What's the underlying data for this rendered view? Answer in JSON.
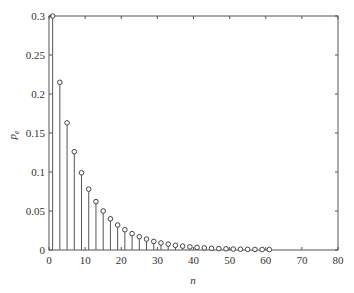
{
  "chart_data": {
    "type": "stem",
    "title": "",
    "xlabel": "n",
    "ylabel": "p_e",
    "xlim": [
      0,
      80
    ],
    "ylim": [
      0,
      0.3
    ],
    "grid": false,
    "legend": null,
    "x_ticks": [
      0,
      10,
      20,
      30,
      40,
      50,
      60,
      70,
      80
    ],
    "y_ticks": [
      0,
      0.05,
      0.1,
      0.15,
      0.2,
      0.25,
      0.3
    ],
    "x_tick_labels": [
      "0",
      "10",
      "20",
      "30",
      "40",
      "50",
      "60",
      "70",
      "80"
    ],
    "y_tick_labels": [
      "0",
      "0.05",
      "0.1",
      "0.15",
      "0.2",
      "0.25",
      "0.3"
    ],
    "marker": "open-circle",
    "series": [
      {
        "name": "p_e",
        "x": [
          1,
          3,
          5,
          7,
          9,
          11,
          13,
          15,
          17,
          19,
          21,
          23,
          25,
          27,
          29,
          31,
          33,
          35,
          37,
          39,
          41,
          43,
          45,
          47,
          49,
          51,
          53,
          55,
          57,
          59,
          61
        ],
        "values": [
          0.3,
          0.215,
          0.163,
          0.126,
          0.099,
          0.078,
          0.062,
          0.05,
          0.04,
          0.032,
          0.026,
          0.021,
          0.017,
          0.014,
          0.011,
          0.009,
          0.0075,
          0.006,
          0.005,
          0.004,
          0.0033,
          0.0027,
          0.0022,
          0.0018,
          0.0015,
          0.0012,
          0.001,
          0.0008,
          0.0007,
          0.0006,
          0.0005
        ]
      }
    ]
  }
}
